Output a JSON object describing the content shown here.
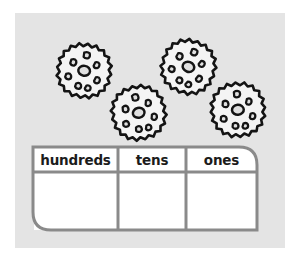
{
  "worksheet": {
    "background_color": "#ffffff",
    "panel_color": "#e4e4e4",
    "border_color": "#8a8a8a",
    "cell_color": "#ffffff",
    "ink_color": "#141414",
    "objects": {
      "icon_name": "gear-cookie-icon",
      "count": 4,
      "items": [
        {
          "id": "gear-1",
          "x": 38,
          "y": 28,
          "size": 62,
          "teeth": 12,
          "rotation": 8
        },
        {
          "id": "gear-2",
          "x": 93,
          "y": 70,
          "size": 62,
          "teeth": 12,
          "rotation": -14
        },
        {
          "id": "gear-3",
          "x": 142,
          "y": 24,
          "size": 62,
          "teeth": 12,
          "rotation": 20
        },
        {
          "id": "gear-4",
          "x": 192,
          "y": 67,
          "size": 62,
          "teeth": 12,
          "rotation": -5
        }
      ]
    },
    "place_value_table": {
      "name": "place-value-chart",
      "columns": [
        {
          "key": "hundreds",
          "label": "hundreds",
          "value": ""
        },
        {
          "key": "tens",
          "label": "tens",
          "value": ""
        },
        {
          "key": "ones",
          "label": "ones",
          "value": ""
        }
      ]
    }
  }
}
